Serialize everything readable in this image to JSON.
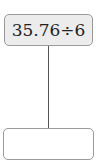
{
  "diagram": {
    "top_box": {
      "expression": "35.76÷6"
    },
    "bottom_box": {
      "answer": ""
    }
  }
}
